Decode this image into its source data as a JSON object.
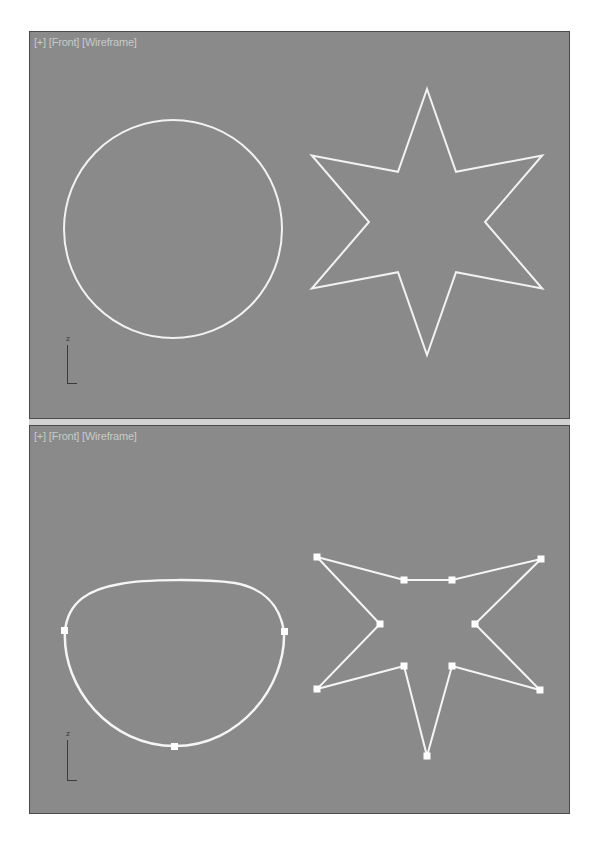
{
  "viewports": [
    {
      "id": "top",
      "label_parts": [
        "[+]",
        "[Front]",
        "[Wireframe]"
      ],
      "shapes": {
        "circle": {
          "type": "circle",
          "cx": 143,
          "cy": 197,
          "r": 109,
          "selected": false
        },
        "star": {
          "type": "star",
          "points": 6,
          "cx": 397,
          "cy": 190,
          "outer_radius": 133,
          "inner_radius": 58,
          "selected": false
        }
      },
      "axis": {
        "label": "z"
      }
    },
    {
      "id": "bottom",
      "label_parts": [
        "[+]",
        "[Front]",
        "[Wireframe]"
      ],
      "shapes": {
        "circle": {
          "type": "edited-spline",
          "vertices": [
            [
              35,
              205
            ],
            [
              254,
              206
            ],
            [
              145,
              320
            ]
          ],
          "selected": true
        },
        "star": {
          "type": "edited-star",
          "vertices": [
            [
              287,
              131
            ],
            [
              374,
              154
            ],
            [
              422,
              154
            ],
            [
              511,
              133
            ],
            [
              445,
              198
            ],
            [
              510,
              264
            ],
            [
              422,
              240
            ],
            [
              397,
              330
            ],
            [
              374,
              240
            ],
            [
              287,
              263
            ],
            [
              350,
              198
            ]
          ],
          "selected": true
        }
      },
      "axis": {
        "label": "z"
      }
    }
  ],
  "colors": {
    "viewport_bg": "#8a8a8a",
    "spline": "#f2f2f2",
    "label": "#c9c9c9",
    "separator": "#d2d2d2",
    "border": "#4a4a4a"
  }
}
